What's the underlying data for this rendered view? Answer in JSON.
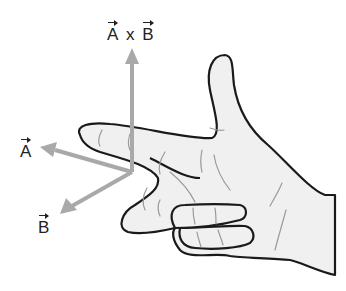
{
  "diagram": {
    "type": "right-hand-rule",
    "labels": {
      "cross_product": {
        "left": "A",
        "operator": "x",
        "right": "B"
      },
      "vector_a": "A",
      "vector_b": "B"
    },
    "colors": {
      "arrow": "#a9a9a9",
      "hand_outline": "#1a1a1a",
      "hand_fill": "#f0f0f0",
      "crease": "#9a9a9a",
      "text": "#222222"
    }
  }
}
